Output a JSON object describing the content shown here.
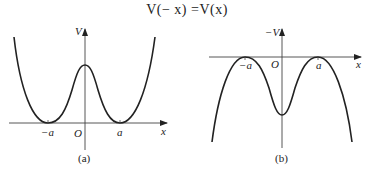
{
  "title": "V(− x) =V(x)",
  "panels": [
    {
      "id": "a",
      "caption": "(a)",
      "y_label": "V",
      "x_label": "x",
      "origin_label": "O",
      "ticks": [
        "−a",
        "a"
      ],
      "description": "Double-well potential V(x) with minima at x = ±a and a local maximum at x = 0"
    },
    {
      "id": "b",
      "caption": "(b)",
      "y_label": "−V",
      "x_label": "x",
      "origin_label": "O",
      "ticks": [
        "−a",
        "a"
      ],
      "description": "Inverted potential −V(x) with maxima at x = ±a and a local minimum at x = 0"
    }
  ],
  "colors": {
    "line": "#222222",
    "axis": "#444444"
  }
}
